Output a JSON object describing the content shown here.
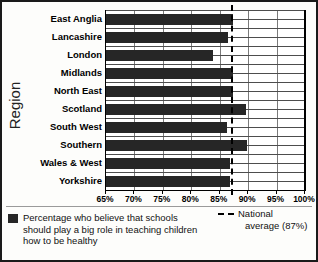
{
  "chart_data": {
    "type": "bar",
    "orientation": "horizontal",
    "title": "",
    "xlabel": "",
    "ylabel": "Region",
    "categories": [
      "East Anglia",
      "Lancashire",
      "London",
      "Midlands",
      "North East",
      "Scotland",
      "South West",
      "Southern",
      "Wales & West",
      "Yorkshire"
    ],
    "values": [
      87.4,
      86.4,
      83.8,
      87.3,
      87.4,
      89.7,
      86.3,
      89.8,
      86.8,
      86.8
    ],
    "series": [
      {
        "name": "Percentage who believe that schools should play a big role in teaching children how to be healthy",
        "values": [
          87.4,
          86.4,
          83.8,
          87.3,
          87.4,
          89.7,
          86.3,
          89.8,
          86.8,
          86.8
        ]
      }
    ],
    "xlim": [
      65,
      100
    ],
    "xticks": [
      65,
      70,
      75,
      80,
      85,
      90,
      95,
      100
    ],
    "xtick_labels": [
      "65%",
      "70%",
      "75%",
      "80%",
      "85%",
      "90%",
      "95%",
      "100%"
    ],
    "grid": "both",
    "reference_line": {
      "label": "National average (87%)",
      "value": 87,
      "style": "dashed"
    },
    "legend_position": "bottom",
    "bar_color": "#262626"
  },
  "axes": {
    "y_title": "Region"
  },
  "legend": {
    "series_label_line1": "Percentage who believe that schools",
    "series_label_line2": "should play a big role in teaching",
    "series_label_line3": "children how to be healthy",
    "average_label_line1": "National",
    "average_label_line2": "average (87%)"
  }
}
